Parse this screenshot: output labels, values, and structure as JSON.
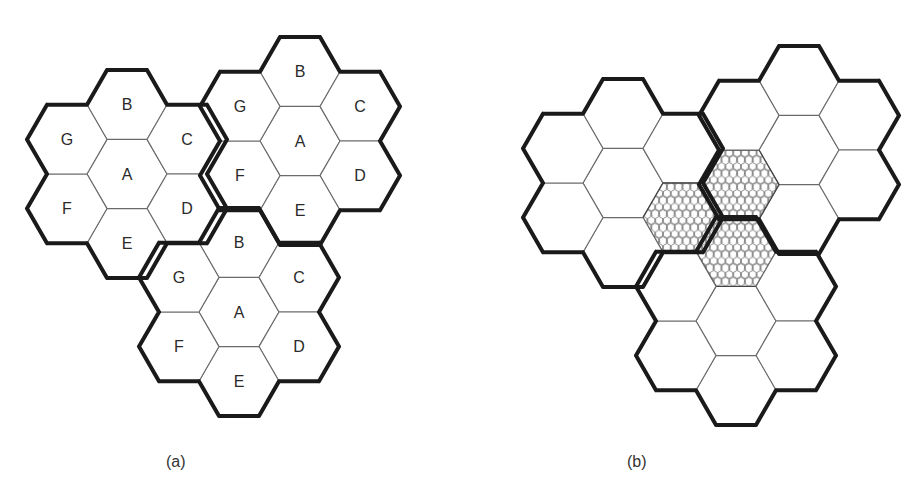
{
  "figure": {
    "hex_radius": 40,
    "cell_labels": [
      "A",
      "B",
      "C",
      "D",
      "E",
      "F",
      "G"
    ],
    "colors": {
      "background": "#ffffff",
      "cell_stroke": "#6a6a6a",
      "cluster_outline": "#1a1a1a",
      "label": "#2a2a2a"
    },
    "panels": [
      {
        "id": "a",
        "caption": "(a)",
        "show_labels": true,
        "clusters": [
          {
            "center": [
              127,
              174
            ]
          },
          {
            "center": [
              300,
              141
            ]
          },
          {
            "center": [
              239,
              312
            ]
          }
        ],
        "shaded_cells": []
      },
      {
        "id": "b",
        "caption": "(b)",
        "show_labels": false,
        "clusters": [
          {
            "center": [
              623,
              183
            ]
          },
          {
            "center": [
              799,
              150
            ]
          },
          {
            "center": [
              736,
              321
            ]
          }
        ],
        "shaded_cells": [
          {
            "cluster": 0,
            "cell": "D"
          },
          {
            "cluster": 1,
            "cell": "F"
          },
          {
            "cluster": 2,
            "cell": "B"
          }
        ]
      }
    ]
  }
}
